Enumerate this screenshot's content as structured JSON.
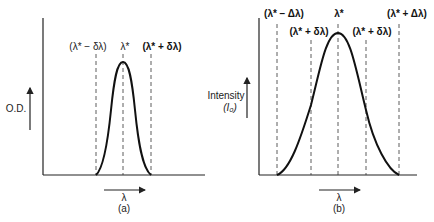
{
  "figure": {
    "panel_a": {
      "caption": "(a)",
      "y_label": "O.D.",
      "x_label": "λ",
      "markers": [
        {
          "label": "(λ* − δλ)"
        },
        {
          "label": "λ*"
        },
        {
          "label": "(λ* + δλ)"
        }
      ]
    },
    "panel_b": {
      "caption": "(b)",
      "y_label_line1": "Intensity",
      "y_label_line2": "(I₀)",
      "x_label": "λ",
      "markers": [
        {
          "label": "(λ* − Δλ)"
        },
        {
          "label": "(λ* + δλ)"
        },
        {
          "label": "λ*"
        },
        {
          "label": "(λ* + δλ)"
        },
        {
          "label": "(λ* + Δλ)"
        }
      ]
    }
  }
}
